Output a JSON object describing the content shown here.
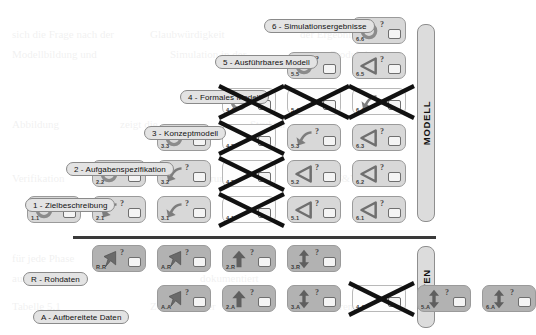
{
  "diagram": {
    "sections": [
      {
        "key": "modell",
        "label": "MODELL"
      },
      {
        "key": "daten",
        "label": "DATEN"
      }
    ],
    "phase_labels": [
      {
        "id": "p1",
        "text": "1 - Zielbeschreibung"
      },
      {
        "id": "p2",
        "text": "2 - Aufgabenspezifikation"
      },
      {
        "id": "p3",
        "text": "3 - Konzeptmodell"
      },
      {
        "id": "p4",
        "text": "4 - Formales Modell"
      },
      {
        "id": "p5",
        "text": "5 - Ausführbares Modell"
      },
      {
        "id": "p6",
        "text": "6 - Simulationsergebnisse"
      },
      {
        "id": "pR",
        "text": "R - Rohdaten"
      },
      {
        "id": "pA",
        "text": "A - Aufbereitete Daten"
      }
    ],
    "icon_names": {
      "circular-arrow": "circular-arrow-icon",
      "bent-arrow": "bent-arrow-icon",
      "triangle-left": "triangle-left-icon",
      "up-arrow": "up-arrow-icon",
      "double-arrow": "double-arrow-icon",
      "flag-arrow": "flag-arrow-icon"
    },
    "cells": [
      {
        "label": "6.6",
        "icon": "circular-arrow",
        "marker": "?",
        "tone": "light",
        "crossed": false
      },
      {
        "label": "5.5",
        "icon": "circular-arrow",
        "marker": "?",
        "tone": "light",
        "crossed": false
      },
      {
        "label": "6.5",
        "icon": "triangle-left",
        "marker": "?",
        "tone": "light",
        "crossed": false
      },
      {
        "label": "4.4",
        "icon": "circular-arrow",
        "marker": "?",
        "tone": "empty",
        "crossed": true
      },
      {
        "label": "5.4",
        "icon": "none",
        "marker": "",
        "tone": "empty",
        "crossed": true
      },
      {
        "label": "6.4",
        "icon": "bent-arrow",
        "marker": "",
        "tone": "empty",
        "crossed": true
      },
      {
        "label": "3.3",
        "icon": "circular-arrow",
        "marker": "?",
        "tone": "light",
        "crossed": false
      },
      {
        "label": "4.3",
        "icon": "none",
        "marker": "",
        "tone": "empty",
        "crossed": true
      },
      {
        "label": "5.3",
        "icon": "bent-arrow",
        "marker": "?",
        "tone": "light",
        "crossed": false
      },
      {
        "label": "6.3",
        "icon": "triangle-left",
        "marker": "?",
        "tone": "light",
        "crossed": false
      },
      {
        "label": "2.2",
        "icon": "circular-arrow",
        "marker": "?",
        "tone": "light",
        "crossed": false
      },
      {
        "label": "3.2",
        "icon": "bent-arrow",
        "marker": "?",
        "tone": "light",
        "crossed": false
      },
      {
        "label": "4.2",
        "icon": "none",
        "marker": "",
        "tone": "empty",
        "crossed": true
      },
      {
        "label": "5.2",
        "icon": "triangle-left",
        "marker": "?",
        "tone": "light",
        "crossed": false
      },
      {
        "label": "6.2",
        "icon": "triangle-left",
        "marker": "?",
        "tone": "light",
        "crossed": false
      },
      {
        "label": "1.1",
        "icon": "circular-arrow",
        "marker": "?",
        "tone": "light",
        "crossed": false
      },
      {
        "label": "2.1",
        "icon": "bent-arrow",
        "marker": "?",
        "tone": "light",
        "crossed": false
      },
      {
        "label": "3.1",
        "icon": "bent-arrow",
        "marker": "?",
        "tone": "light",
        "crossed": false
      },
      {
        "label": "4.1",
        "icon": "none",
        "marker": "",
        "tone": "empty",
        "crossed": true
      },
      {
        "label": "5.1",
        "icon": "triangle-left",
        "marker": "?",
        "tone": "light",
        "crossed": false
      },
      {
        "label": "6.1",
        "icon": "triangle-left",
        "marker": "?",
        "tone": "light",
        "crossed": false
      },
      {
        "label": "R.R",
        "icon": "flag-arrow",
        "marker": "?",
        "tone": "dark",
        "crossed": false
      },
      {
        "label": "A.R",
        "icon": "flag-arrow",
        "marker": "?",
        "tone": "dark",
        "crossed": false
      },
      {
        "label": "2.R",
        "icon": "up-arrow",
        "marker": "?",
        "tone": "dark",
        "crossed": false
      },
      {
        "label": "3.R",
        "icon": "double-arrow",
        "marker": "?",
        "tone": "dark",
        "crossed": false
      },
      {
        "label": "A.A",
        "icon": "flag-arrow",
        "marker": "?",
        "tone": "dark",
        "crossed": false
      },
      {
        "label": "2.A",
        "icon": "up-arrow",
        "marker": "?",
        "tone": "dark",
        "crossed": false
      },
      {
        "label": "3.A",
        "icon": "double-arrow",
        "marker": "?",
        "tone": "dark",
        "crossed": false
      },
      {
        "label": "4.A",
        "icon": "none",
        "marker": "",
        "tone": "empty",
        "crossed": true
      },
      {
        "label": "5.A",
        "icon": "double-arrow",
        "marker": "?",
        "tone": "dark",
        "crossed": false
      },
      {
        "label": "6.A",
        "icon": "double-arrow",
        "marker": "?",
        "tone": "dark",
        "crossed": false
      }
    ],
    "colors": {
      "cell_light": "#d8d8d8",
      "cell_dark": "#b2b2b2",
      "cell_empty": "#fdfdfd",
      "pill": "#e3e3e3",
      "sidebar": "#dcdcdc",
      "stroke": "#1a1a1a"
    }
  }
}
